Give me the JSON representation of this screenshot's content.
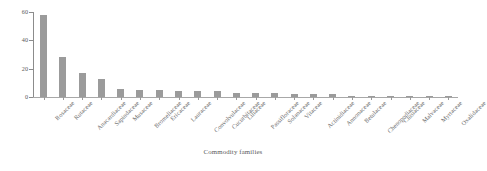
{
  "chart_data": {
    "type": "bar",
    "title": "",
    "xlabel": "Commodity families",
    "ylabel": "",
    "ylim": [
      0,
      60
    ],
    "yticks": [
      0,
      20,
      40,
      60
    ],
    "grid": false,
    "legend": false,
    "bar_color": "#9b9b9b",
    "background": "#ffffff",
    "categories": [
      "Rosaceae",
      "Rutaceae",
      "Anacardiaceae",
      "Sapindaceae",
      "Musaceae",
      "Bromeliaceae",
      "Ericaceae",
      "Lauraceae",
      "Convolvulaceae",
      "Cucurbitaceae",
      "Liliaceae",
      "Passifloraceae",
      "Solanaceae",
      "Vitaceae",
      "Actinidiaceae",
      "Annonaceae",
      "Betulaceae",
      "Chenopodiaceae",
      "Clusiaceae",
      "Malvaceae",
      "Myrtaceae",
      "Oxalidaceae"
    ],
    "values": [
      58,
      28,
      17,
      13,
      6,
      5,
      5,
      4,
      4,
      4,
      3,
      3,
      3,
      2,
      2,
      2,
      1,
      1,
      1,
      1,
      1,
      1
    ]
  }
}
